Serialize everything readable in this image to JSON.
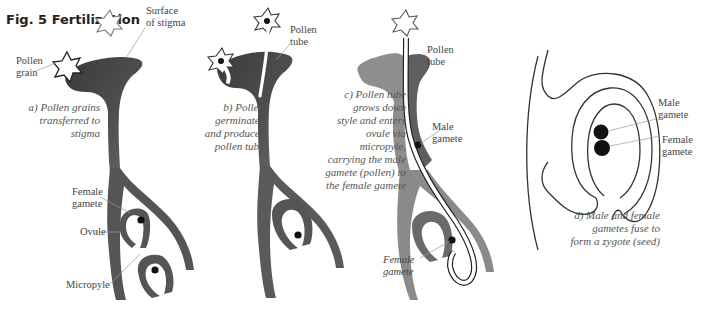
{
  "figure": {
    "title": "Fig. 5 Fertilization"
  },
  "panels": [
    {
      "id": "a",
      "caption": [
        "a) Pollen grains",
        "transferred to",
        "stigma"
      ],
      "labels": {
        "pollen_grain": [
          "Pollen",
          "grain"
        ],
        "surface_of_stigma": [
          "Surface",
          "of stigma"
        ],
        "female_gamete": [
          "Female",
          "gamete"
        ],
        "ovule": "Ovule",
        "micropyle": "Micropyle"
      }
    },
    {
      "id": "b",
      "caption": [
        "b) Pollen",
        "germinates",
        "and produces",
        "pollen tube"
      ],
      "labels": {
        "pollen_tube": [
          "Pollen",
          "tube"
        ]
      }
    },
    {
      "id": "c",
      "caption": [
        "c) Pollen tube",
        "grows down",
        "style and enters",
        "ovule via",
        "micropyle,",
        "carrying the male",
        "gamete (pollen) to",
        "the female gamete"
      ],
      "labels": {
        "pollen_tube": [
          "Pollen",
          "tube"
        ],
        "male_gamete": [
          "Male",
          "gamete"
        ],
        "female_gamete": [
          "Female",
          "gamete"
        ]
      }
    },
    {
      "id": "d",
      "caption": [
        "d) Male and female",
        "gametes fuse to",
        "form a zygote (seed)"
      ],
      "labels": {
        "male_gamete": [
          "Male",
          "gamete"
        ],
        "female_gamete": [
          "Female",
          "gamete"
        ]
      }
    }
  ],
  "colors": {
    "tissue_dark": "#4a4a4a",
    "tissue_light": "#8a8a8a",
    "outline": "#333333",
    "leader": "#999999"
  }
}
